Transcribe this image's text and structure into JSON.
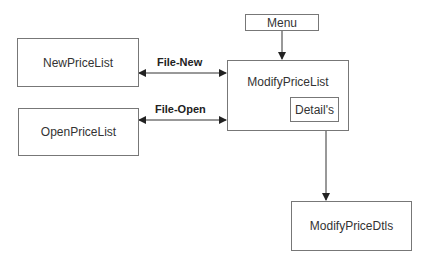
{
  "nodes": {
    "new_price_list": "NewPriceList",
    "open_price_list": "OpenPriceList",
    "menu": "Menu",
    "modify_price_list": "ModifyPriceList",
    "details": "Detail's",
    "modify_price_dtls": "ModifyPriceDtls"
  },
  "edges": {
    "file_new": "File-New",
    "file_open": "File-Open"
  }
}
